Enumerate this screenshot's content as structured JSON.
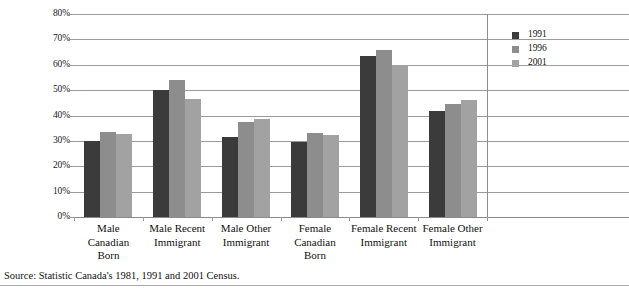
{
  "chart_data": {
    "type": "bar",
    "title": "",
    "xlabel": "",
    "ylabel": "",
    "ylim": [
      0,
      80
    ],
    "ytick_labels": [
      "80%",
      "70%",
      "60%",
      "50%",
      "40%",
      "30%",
      "20%",
      "10%",
      "0%"
    ],
    "ytick_values": [
      80,
      70,
      60,
      50,
      40,
      30,
      20,
      10,
      0
    ],
    "grid": true,
    "legend_position": "right",
    "categories": [
      "Male Canadian Born",
      "Male Recent Immigrant",
      "Male Other Immigrant",
      "Female Canadian Born",
      "Female Recent Immigrant",
      "Female Other Immigrant"
    ],
    "category_lines": [
      [
        "Male",
        "Canadian",
        "Born"
      ],
      [
        "Male Recent",
        "Immigrant"
      ],
      [
        "Male Other",
        "Immigrant"
      ],
      [
        "Female",
        "Canadian",
        "Born"
      ],
      [
        "Female Recent",
        "Immigrant"
      ],
      [
        "Female Other",
        "Immigrant"
      ]
    ],
    "series": [
      {
        "name": "1991",
        "color": "#3b3b3b",
        "values": [
          29.8,
          50.0,
          31.5,
          29.4,
          63.5,
          41.6
        ]
      },
      {
        "name": "1996",
        "color": "#8d8d8d",
        "values": [
          33.7,
          53.8,
          37.4,
          33.2,
          66.0,
          44.4
        ]
      },
      {
        "name": "2001",
        "color": "#a2a2a2",
        "values": [
          32.9,
          46.6,
          38.6,
          32.4,
          59.8,
          46.0
        ]
      }
    ]
  },
  "legend": {
    "items": [
      {
        "label": "1991",
        "color": "#3b3b3b"
      },
      {
        "label": "1996",
        "color": "#8d8d8d"
      },
      {
        "label": "2001",
        "color": "#a2a2a2"
      }
    ]
  },
  "footer": {
    "source": "Source: Statistic Canada's 1981, 1991 and 2001 Census."
  }
}
